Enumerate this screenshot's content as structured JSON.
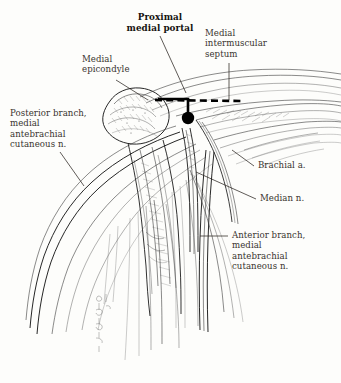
{
  "figure": {
    "title": "Proximal medial portal",
    "background_color": "#fdfdfb",
    "ink_color": "#1b1b1b",
    "label_color": "#39342f"
  },
  "labels": {
    "proximal_medial_portal": "Proximal\nmedial portal",
    "medial_intermuscular_septum": "Medial\nintermuscular\nseptum",
    "medial_epicondyle": "Medial\nepicondyle",
    "posterior_branch_mabc": "Posterior branch,\nmedial\nantebrachial\ncutaneous n.",
    "brachial_artery": "Brachial a.",
    "median_nerve": "Median n.",
    "anterior_branch_mabc": "Anterior branch,\nmedial\nantebrachial\ncutaneous n."
  },
  "markers": {
    "portal_site_label": "portal-entry-point",
    "septum_line_label": "medial-intermuscular-septum-dashed-line"
  }
}
